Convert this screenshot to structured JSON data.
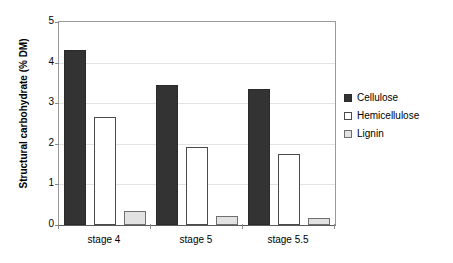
{
  "chart_data": {
    "type": "bar",
    "title": "",
    "xlabel": "",
    "ylabel": "Structural carbohydrate (% DM)",
    "categories": [
      "stage 4",
      "stage 5",
      "stage 5.5"
    ],
    "series": [
      {
        "name": "Cellulose",
        "values": [
          4.3,
          3.45,
          3.35
        ],
        "color": "#333333"
      },
      {
        "name": "Hemicellulose",
        "values": [
          2.67,
          1.93,
          1.74
        ],
        "color": "#ffffff"
      },
      {
        "name": "Lignin",
        "values": [
          0.35,
          0.22,
          0.18
        ],
        "color": "#e2e2e2"
      }
    ],
    "ylim": [
      0,
      5
    ],
    "yticks": [
      "0",
      "1",
      "2",
      "3",
      "4",
      "5"
    ],
    "ytick_values": [
      0,
      1,
      2,
      3,
      4,
      5
    ],
    "grid": true,
    "legend_position": "right"
  },
  "axis": {
    "y_title": "Structural carbohydrate (% DM)"
  },
  "legend": {
    "items": [
      {
        "label": "Cellulose"
      },
      {
        "label": "Hemicellulose"
      },
      {
        "label": "Lignin"
      }
    ]
  }
}
